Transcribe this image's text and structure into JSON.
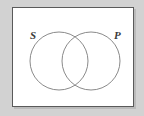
{
  "figure": {
    "kind": "venn-diagram",
    "panel": {
      "background_color": "#ffffff",
      "border_color": "#5a5a5a"
    },
    "canvas": {
      "background_color": "#d2d2d2"
    },
    "labels": {
      "left": "S",
      "right": "P"
    },
    "circles": [
      {
        "name": "subject-circle",
        "label": "S",
        "cx": 46,
        "cy": 53,
        "r": 29,
        "stroke_color": "#8a8a8a"
      },
      {
        "name": "predicate-circle",
        "label": "P",
        "cx": 78,
        "cy": 53,
        "r": 29,
        "stroke_color": "#8a8a8a"
      }
    ]
  }
}
